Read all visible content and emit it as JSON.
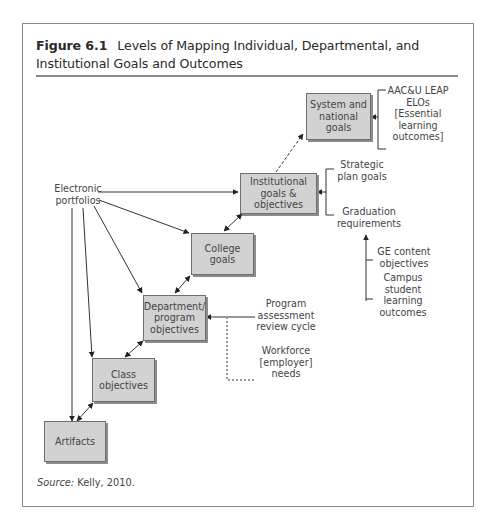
{
  "figure": {
    "number": "Figure 6.1",
    "title": "Levels of Mapping Individual, Departmental, and Institutional Goals and Outcomes",
    "source_label": "Source:",
    "source_text": " Kelly, 2010."
  },
  "colors": {
    "box_fill": "#d2d2d2",
    "box_border": "#6e6e6e",
    "frame_border": "#8a8a8a",
    "line": "#333333"
  },
  "nodes": {
    "system": "System and national goals",
    "institutional": "Institutional goals & objectives",
    "college": "College goals",
    "department": "Department/ program objectives",
    "class": "Class objectives",
    "artifacts": "Artifacts"
  },
  "labels": {
    "eportfolios": "Electronic portfolios",
    "aacu": "AAC&U LEAP ELOs [Essential learning outcomes]",
    "strategic": "Strategic plan goals",
    "graduation": "Graduation requirements",
    "ge_content": "GE content objectives",
    "campus_slo": "Campus student learning outcomes",
    "program_review": "Program assessment review cycle",
    "workforce": "Workforce [employer] needs"
  }
}
